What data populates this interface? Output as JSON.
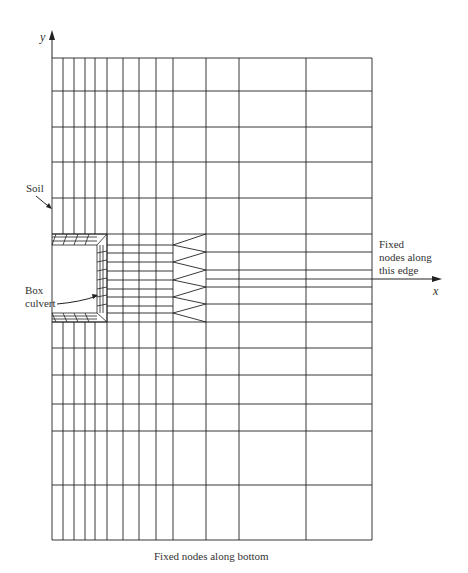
{
  "diagram": {
    "type": "finite-element-mesh",
    "axes": {
      "y_label": "y",
      "x_label": "x"
    },
    "labels": {
      "soil": "Soil",
      "culvert_line1": "Box",
      "culvert_line2": "culvert",
      "fixed_edge_line1": "Fixed",
      "fixed_edge_line2": "nodes along",
      "fixed_edge_line3": "this edge",
      "fixed_bottom": "Fixed nodes along bottom"
    },
    "mesh": {
      "vertical_lines_x": [
        52,
        63,
        74,
        85,
        95,
        107,
        123,
        139,
        156,
        173,
        206,
        239,
        306,
        372
      ],
      "upper_horizontal_y": [
        58,
        91,
        127,
        162,
        198,
        234
      ],
      "lower_horizontal_y": [
        322,
        348,
        375,
        404,
        431,
        485,
        540
      ],
      "middle_fine_y": [
        245,
        253,
        262,
        271,
        280,
        289,
        297,
        306,
        313
      ],
      "middle_coarse_y": [
        252,
        270,
        279,
        287,
        304
      ],
      "transition_zone_x": [
        173,
        206
      ]
    },
    "line_color": "#222222"
  }
}
